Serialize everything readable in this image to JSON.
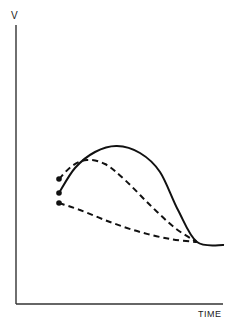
{
  "chart_data": {
    "type": "line",
    "title": "",
    "xlabel": "TIME",
    "ylabel": "V",
    "grid": false,
    "legend": null,
    "series": [
      {
        "name": "solid curve",
        "style": "solid",
        "start_marker": true,
        "points_px": [
          [
            59,
            193
          ],
          [
            75,
            168
          ],
          [
            95,
            152
          ],
          [
            117,
            146
          ],
          [
            140,
            153
          ],
          [
            160,
            172
          ],
          [
            178,
            210
          ],
          [
            197,
            242
          ],
          [
            224,
            245
          ]
        ]
      },
      {
        "name": "upper dashed curve",
        "style": "dashed",
        "start_marker": true,
        "points_px": [
          [
            59,
            179
          ],
          [
            72,
            166
          ],
          [
            87,
            160
          ],
          [
            105,
            164
          ],
          [
            125,
            180
          ],
          [
            150,
            205
          ],
          [
            175,
            228
          ],
          [
            197,
            242
          ]
        ]
      },
      {
        "name": "lower dashed curve",
        "style": "dashed",
        "start_marker": true,
        "points_px": [
          [
            59,
            203
          ],
          [
            80,
            210
          ],
          [
            110,
            222
          ],
          [
            140,
            232
          ],
          [
            170,
            239
          ],
          [
            197,
            242
          ]
        ]
      }
    ]
  },
  "labels": {
    "y_axis": "V",
    "x_axis": "TIME"
  },
  "colors": {
    "ink": "#111111",
    "axis": "#333333",
    "background": "#ffffff"
  }
}
